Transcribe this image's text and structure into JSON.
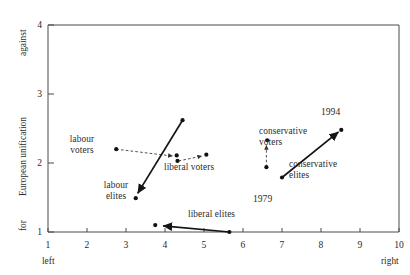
{
  "chart_data": {
    "type": "scatter",
    "title": "",
    "xlabel": "",
    "ylabel": "European unification",
    "xlim": [
      1,
      10
    ],
    "ylim": [
      1,
      4
    ],
    "grid": false,
    "legend": "none",
    "x_axis": {
      "ticks": [
        "1",
        "2",
        "3",
        "4",
        "5",
        "6",
        "7",
        "8",
        "9",
        "10"
      ],
      "low_end_label": "left",
      "high_end_label": "right"
    },
    "y_axis": {
      "ticks": [
        "1",
        "2",
        "3",
        "4"
      ],
      "low_end_label": "for",
      "high_end_label": "against",
      "name": "European unification"
    },
    "period_labels": [
      {
        "text": "1979",
        "x": 7.0,
        "y": 1.79
      },
      {
        "text": "1994",
        "x": 8.5,
        "y": 2.48
      }
    ],
    "series": [
      {
        "name": "labour voters",
        "style": "dashed",
        "start": {
          "x": 2.75,
          "y": 2.2
        },
        "end": {
          "x": 4.2,
          "y": 2.1
        },
        "points": [
          {
            "x": 2.75,
            "y": 2.2
          },
          {
            "x": 4.3,
            "y": 2.11
          }
        ]
      },
      {
        "name": "labour elites",
        "style": "solid",
        "start": {
          "x": 4.45,
          "y": 2.62
        },
        "end": {
          "x": 3.3,
          "y": 1.56
        },
        "points": [
          {
            "x": 4.45,
            "y": 2.62
          },
          {
            "x": 3.25,
            "y": 1.49
          }
        ]
      },
      {
        "name": "liberal voters",
        "style": "dashed",
        "start": {
          "x": 4.35,
          "y": 2.03
        },
        "end": {
          "x": 4.95,
          "y": 2.1
        },
        "points": [
          {
            "x": 4.32,
            "y": 2.03
          },
          {
            "x": 5.06,
            "y": 2.12
          }
        ]
      },
      {
        "name": "liberal elites",
        "style": "solid",
        "start": {
          "x": 5.65,
          "y": 1.0
        },
        "end": {
          "x": 3.95,
          "y": 1.09
        },
        "points": [
          {
            "x": 5.65,
            "y": 1.0
          },
          {
            "x": 3.75,
            "y": 1.1
          }
        ]
      },
      {
        "name": "conservative voters",
        "style": "dashed",
        "start": {
          "x": 6.6,
          "y": 1.94
        },
        "end": {
          "x": 6.6,
          "y": 2.26
        },
        "points": [
          {
            "x": 6.6,
            "y": 1.94
          },
          {
            "x": 6.62,
            "y": 2.33
          }
        ]
      },
      {
        "name": "conservative elites",
        "style": "solid",
        "start": {
          "x": 7.0,
          "y": 1.79
        },
        "end": {
          "x": 8.45,
          "y": 2.45
        },
        "points": [
          {
            "x": 7.0,
            "y": 1.79
          },
          {
            "x": 8.52,
            "y": 2.48
          }
        ]
      }
    ],
    "annotations": [
      {
        "text": "labour\nvoters",
        "series": "labour voters"
      },
      {
        "text": "labour\nelites",
        "series": "labour elites"
      },
      {
        "text": "liberal voters",
        "series": "liberal voters"
      },
      {
        "text": "liberal elites",
        "series": "liberal elites"
      },
      {
        "text": "conservative\nvoters",
        "series": "conservative voters"
      },
      {
        "text": "conservative\nelites",
        "series": "conservative elites"
      }
    ]
  },
  "labels": {
    "labour_voters": "labour\nvoters",
    "labour_elites": "labour\nelites",
    "liberal_voters": "liberal voters",
    "liberal_elites": "liberal elites",
    "conservative_voters": "conservative\nvoters",
    "conservative_elites": "conservative\nelites",
    "year_1979": "1979",
    "year_1994": "1994",
    "axis_y_name": "European unification",
    "axis_y_low": "for",
    "axis_y_high": "against",
    "axis_x_low": "left",
    "axis_x_high": "right"
  },
  "ticks": {
    "x": [
      "1",
      "2",
      "3",
      "4",
      "5",
      "6",
      "7",
      "8",
      "9",
      "10"
    ],
    "y": [
      "1",
      "2",
      "3",
      "4"
    ]
  }
}
